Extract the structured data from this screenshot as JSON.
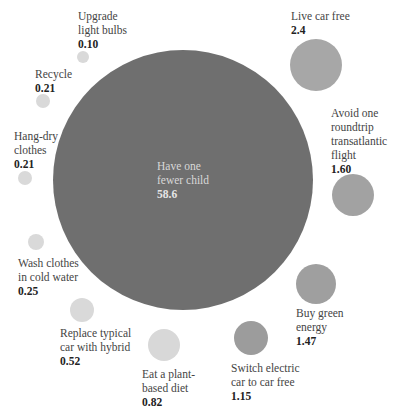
{
  "chart_data": {
    "type": "bubble",
    "title": "",
    "unit": "tonnes CO2-equivalent saved per year",
    "items": [
      {
        "label": "Have one fewer child",
        "value": 58.6,
        "display": "58.6",
        "cx": 183,
        "cy": 180,
        "r": 130,
        "color": "#6f6f6f",
        "lx": 157,
        "ly": 159,
        "lw": 60,
        "big": true
      },
      {
        "label": "Live car free",
        "value": 2.4,
        "display": "2.4",
        "cx": 316,
        "cy": 65,
        "r": 26,
        "color": "#a7a7a7",
        "lx": 291,
        "ly": 9,
        "lw": 90
      },
      {
        "label": "Avoid one roundtrip transatlantic flight",
        "value": 1.6,
        "display": "1.60",
        "cx": 353,
        "cy": 195,
        "r": 21,
        "color": "#a2a2a2",
        "lx": 331,
        "ly": 106,
        "lw": 64
      },
      {
        "label": "Buy green energy",
        "value": 1.47,
        "display": "1.47",
        "cx": 316,
        "cy": 284,
        "r": 20,
        "color": "#9f9f9f",
        "lx": 296,
        "ly": 306,
        "lw": 70
      },
      {
        "label": "Switch electric car to car free",
        "value": 1.15,
        "display": "1.15",
        "cx": 251,
        "cy": 338,
        "r": 17,
        "color": "#9c9c9c",
        "lx": 231,
        "ly": 361,
        "lw": 90
      },
      {
        "label": "Eat a plant-based diet",
        "value": 0.82,
        "display": "0.82",
        "cx": 164,
        "cy": 345,
        "r": 16,
        "color": "#d8d8d8",
        "lx": 142,
        "ly": 367,
        "lw": 60
      },
      {
        "label": "Replace typical car with hybrid",
        "value": 0.52,
        "display": "0.52",
        "cx": 82,
        "cy": 310,
        "r": 12,
        "color": "#d9d9d9",
        "lx": 60,
        "ly": 326,
        "lw": 80
      },
      {
        "label": "Wash clothes in cold water",
        "value": 0.25,
        "display": "0.25",
        "cx": 36,
        "cy": 242,
        "r": 8,
        "color": "#d9d9d9",
        "lx": 18,
        "ly": 256,
        "lw": 80
      },
      {
        "label": "Hang-dry clothes",
        "value": 0.21,
        "display": "0.21",
        "cx": 25,
        "cy": 178,
        "r": 7,
        "color": "#d9d9d9",
        "lx": 14,
        "ly": 129,
        "lw": 60
      },
      {
        "label": "Recycle",
        "value": 0.21,
        "display": "0.21",
        "cx": 43,
        "cy": 101,
        "r": 7,
        "color": "#d9d9d9",
        "lx": 35,
        "ly": 67,
        "lw": 60
      },
      {
        "label": "Upgrade light bulbs",
        "value": 0.1,
        "display": "0.10",
        "cx": 83,
        "cy": 57,
        "r": 6,
        "color": "#d9d9d9",
        "lx": 78,
        "ly": 9,
        "lw": 70
      }
    ],
    "text_lines": {
      "Have one fewer child": [
        "Have one",
        "fewer child"
      ],
      "Live car free": [
        "Live car free"
      ],
      "Avoid one roundtrip transatlantic flight": [
        "Avoid one",
        "roundtrip",
        "transatlantic",
        "flight"
      ],
      "Buy green energy": [
        "Buy green",
        "energy"
      ],
      "Switch electric car to car free": [
        "Switch electric",
        "car to car free"
      ],
      "Eat a plant-based diet": [
        "Eat a plant-",
        "based diet"
      ],
      "Replace typical car with hybrid": [
        "Replace typical",
        "car with hybrid"
      ],
      "Wash clothes in cold water": [
        "Wash clothes",
        "in cold water"
      ],
      "Hang-dry clothes": [
        "Hang-dry",
        "clothes"
      ],
      "Recycle": [
        "Recycle"
      ],
      "Upgrade light bulbs": [
        "Upgrade",
        "light bulbs"
      ]
    },
    "legend": null,
    "grid": false
  }
}
